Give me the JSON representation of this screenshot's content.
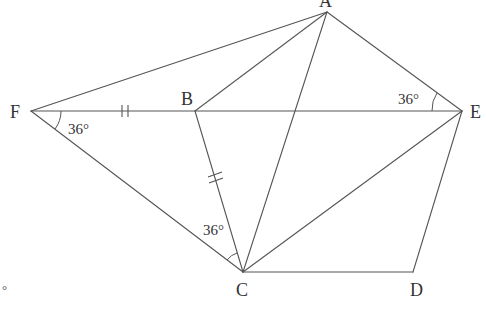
{
  "figure": {
    "type": "geometry-diagram",
    "points": {
      "A": {
        "label": "A",
        "x": 327,
        "y": 12
      },
      "B": {
        "label": "B",
        "x": 195,
        "y": 111
      },
      "C": {
        "label": "C",
        "x": 243,
        "y": 272
      },
      "D": {
        "label": "D",
        "x": 413,
        "y": 272
      },
      "E": {
        "label": "E",
        "x": 462,
        "y": 111
      },
      "F": {
        "label": "F",
        "x": 31,
        "y": 111
      }
    },
    "segments": [
      [
        "F",
        "A"
      ],
      [
        "F",
        "E"
      ],
      [
        "F",
        "C"
      ],
      [
        "A",
        "B"
      ],
      [
        "A",
        "C"
      ],
      [
        "A",
        "E"
      ],
      [
        "B",
        "C"
      ],
      [
        "B",
        "E"
      ],
      [
        "C",
        "E"
      ],
      [
        "C",
        "D"
      ],
      [
        "D",
        "E"
      ]
    ],
    "angles": [
      {
        "vertex": "F",
        "label": "36°"
      },
      {
        "vertex": "E",
        "label": "36°"
      },
      {
        "vertex": "C",
        "label": "36°"
      }
    ],
    "equal_marks": [
      {
        "segment": [
          "F",
          "B"
        ],
        "mark": "double-tick"
      },
      {
        "segment": [
          "B",
          "C"
        ],
        "mark": "double-tick"
      }
    ],
    "stray_mark": "°"
  }
}
